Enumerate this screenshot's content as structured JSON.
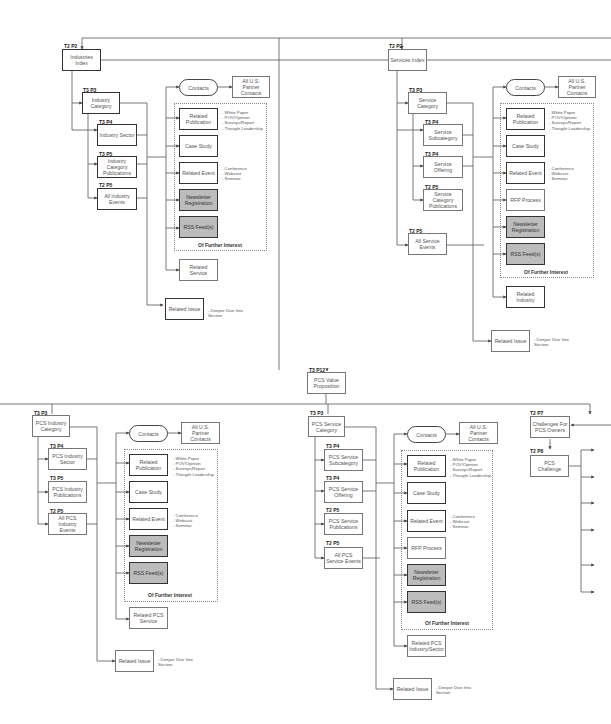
{
  "diagram": {
    "top": {
      "industries_index": {
        "tag": "T2 P2",
        "label": "Industries Index"
      },
      "services_index": {
        "tag": "T2 P2",
        "label": "Services Index"
      }
    },
    "industries": {
      "category": {
        "tag": "T3 P3",
        "label": "Industry Category"
      },
      "sector": {
        "tag": "T3 P4",
        "label": "Industry Sector"
      },
      "publications": {
        "tag": "T3 P5",
        "label": "Industry Category Publications"
      },
      "events": {
        "tag": "T2 P5",
        "label": "All Industry Events"
      },
      "contacts": "Contacts",
      "partner_contacts": "All U.S. Partner Contacts",
      "related_publication": "Related Publication",
      "publication_notes": [
        "- White Paper",
        "- POV/Opinion",
        "- Surveys/Report",
        "- Thought Leadership"
      ],
      "case_study": "Case Study",
      "related_event": "Related Event",
      "event_notes": [
        "- Conference",
        "- Webcast",
        "- Seminar"
      ],
      "newsletter": "Newsletter Registration",
      "rss": "RSS Feed(s)",
      "further_interest": "Of Further Interest",
      "related_service": "Related Service",
      "related_issue": "Related Issue",
      "issue_notes": [
        "- Deeper Dive Into",
        "Section"
      ]
    },
    "services": {
      "category": {
        "tag": "T3 P3",
        "label": "Service Category"
      },
      "subcategory": {
        "tag": "T3 P4",
        "label": "Service Subcategory"
      },
      "offering": {
        "tag": "T3 P4",
        "label": "Service Offering"
      },
      "publications": {
        "tag": "T2 P5",
        "label": "Service Category Publications"
      },
      "events": {
        "tag": "T2 P5",
        "label": "All Service Events"
      },
      "contacts": "Contacts",
      "partner_contacts": "All U.S. Partner Contacts",
      "related_publication": "Related Publication",
      "publication_notes": [
        "- White Paper",
        "- POV/Opinion",
        "- Surveys/Report",
        "- Thought Leadership"
      ],
      "case_study": "Case Study",
      "related_event": "Related Event",
      "event_notes": [
        "- Conference",
        "- Webcast",
        "- Seminar"
      ],
      "rfp": "RFP Process",
      "newsletter": "Newsletter Registration",
      "rss": "RSS Feed(s)",
      "further_interest": "Of Further Interest",
      "related_industry": "Related Industry",
      "related_issue": "Related Issue",
      "issue_notes": [
        "- Deeper Dive Into",
        "Section"
      ]
    },
    "pcs_value": {
      "tag": "T3 P12",
      "label": "PCS Value Proposition"
    },
    "pcs_industries": {
      "category": {
        "tag": "T3 P3",
        "label": "PCS Industry Category"
      },
      "sector": {
        "tag": "T3 P4",
        "label": "PCS Industry Sector"
      },
      "publications": {
        "tag": "T3 P5",
        "label": "PCS Industry Publications"
      },
      "events": {
        "tag": "T2 P5",
        "label": "All PCS Industry Events"
      },
      "contacts": "Contacts",
      "partner_contacts": "All U.S. Partner Contacts",
      "related_publication": "Related Publication",
      "publication_notes": [
        "- White Paper",
        "- POV/Opinion",
        "- Surveys/Report",
        "- Thought Leadership"
      ],
      "case_study": "Case Study",
      "related_event": "Related Event",
      "event_notes": [
        "- Conference",
        "- Webcast",
        "- Seminar"
      ],
      "newsletter": "Newsletter Registration",
      "rss": "RSS Feed(s)",
      "further_interest": "Of Further Interest",
      "related_service": "Related PCS Service",
      "related_issue": "Related Issue",
      "issue_notes": [
        "- Deeper Dive Into",
        "Section"
      ]
    },
    "pcs_services": {
      "category": {
        "tag": "T3 P3",
        "label": "PCS Service Category"
      },
      "subcategory": {
        "tag": "T3 P4",
        "label": "PCS Service Subcategory"
      },
      "offering": {
        "tag": "T3 P4",
        "label": "PCS Service Offering"
      },
      "publications": {
        "tag": "T2 P5",
        "label": "PCS Service Publications"
      },
      "events": {
        "tag": "T2 P5",
        "label": "All PCS Service Events"
      },
      "contacts": "Contacts",
      "partner_contacts": "All U.S. Partner Contacts",
      "related_publication": "Related Publication",
      "publication_notes": [
        "- White Paper",
        "- POV/Opinion",
        "- Surveys/Report",
        "- Thought Leadership"
      ],
      "case_study": "Case Study",
      "related_event": "Related Event",
      "event_notes": [
        "- Conference",
        "- Webcast",
        "- Seminar"
      ],
      "rfp": "RFP Process",
      "newsletter": "Newsletter Registration",
      "rss": "RSS Feed(s)",
      "further_interest": "Of Further Interest",
      "related_industry": "Related PCS Industry/Sector",
      "related_issue": "Related Issue",
      "issue_notes": [
        "- Deeper Dive Into",
        "Section"
      ]
    },
    "challenges": {
      "owners": {
        "tag": "T2 P7",
        "label": "Challenges For PCS Owners"
      },
      "challenge": {
        "tag": "T2 P8",
        "label": "PCS Challenge"
      }
    }
  }
}
